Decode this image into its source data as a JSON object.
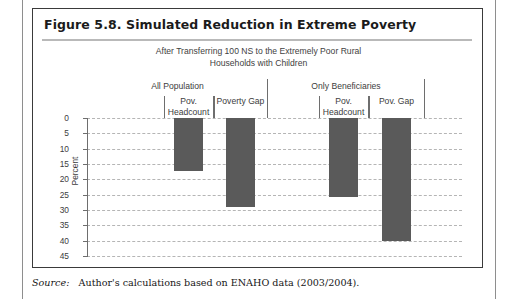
{
  "page": {
    "source_note_label": "Source:",
    "source_note_text": "Author's calculations based on ENAHO data (2003/2004)."
  },
  "figure": {
    "title": "Figure 5.8.  Simulated Reduction in Extreme Poverty",
    "subtitle_line1": "After Transferring 100 NS to the Extremely Poor Rural",
    "subtitle_line2": "Households with Children"
  },
  "chart_data": {
    "type": "bar",
    "title": "Simulated Reduction in Extreme Poverty",
    "subtitle": "After Transferring 100 NS to the Extremely Poor Rural Households with Children",
    "xlabel": "",
    "ylabel": "Percent",
    "ylim": [
      0,
      45
    ],
    "y_inverted": true,
    "grid": true,
    "legend": "none",
    "bar_color": "#5a5a5a",
    "yticks": [
      0,
      5,
      10,
      15,
      20,
      25,
      30,
      35,
      40,
      45
    ],
    "ytick_labels": [
      "0",
      "5",
      "10",
      "15",
      "20",
      "25",
      "30",
      "35",
      "40",
      "45"
    ],
    "groups": [
      {
        "name": "All Population",
        "categories": [
          "Pov. Headcount",
          "Poverty Gap"
        ],
        "values": [
          17.3,
          29.0
        ]
      },
      {
        "name": "Only Beneficiaries",
        "categories": [
          "Pov. Headcount",
          "Pov. Gap"
        ],
        "values": [
          25.7,
          40.0
        ]
      }
    ],
    "categories": [
      "Pov. Headcount",
      "Poverty Gap",
      "Pov. Headcount",
      "Pov. Gap"
    ],
    "values": [
      17.3,
      29.0,
      25.7,
      40.0
    ]
  }
}
